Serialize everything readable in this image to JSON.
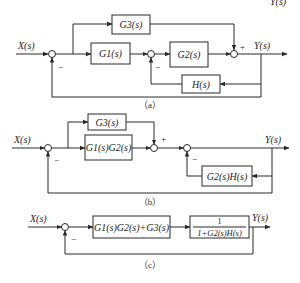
{
  "top_fragment": "Y(s)",
  "diagram_a": {
    "caption": "（a）",
    "input_label": "X(s)",
    "output_label": "Y(s)",
    "blocks": {
      "g3": "G3(s)",
      "g1": "G1(s)",
      "g2": "G2(s)",
      "h": "H(s)"
    },
    "signs": {
      "sum1_minus": "−",
      "sum2_minus": "−",
      "sum3_plus": "+"
    }
  },
  "diagram_b": {
    "caption": "（b）",
    "input_label": "X(s)",
    "output_label": "Y(s)",
    "blocks": {
      "g3": "G3(s)",
      "g1g2": "G1(s)G2(s)",
      "g2h": "G2(s)H(s)"
    },
    "signs": {
      "sum1_minus": "−",
      "sum2_plus": "+",
      "sum3_minus": "−"
    }
  },
  "diagram_c": {
    "caption": "（c）",
    "input_label": "X(s)",
    "output_label": "Y(s)",
    "blocks": {
      "forward": "G1(s)G2(s)+G3(s)",
      "closed_numerator": "1",
      "closed_denominator": "1+G2(s)H(s)"
    },
    "signs": {
      "sum1_minus": "−"
    }
  }
}
